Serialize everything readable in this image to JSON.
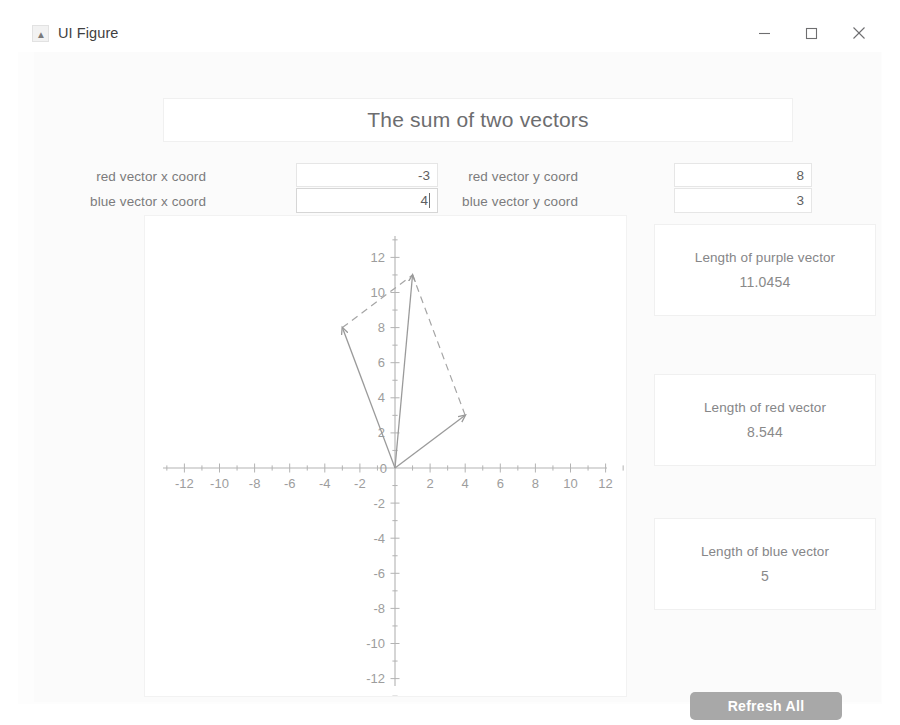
{
  "window": {
    "title": "UI Figure",
    "icon": "matlab-app-icon",
    "controls": {
      "minimize": "minimize-icon",
      "maximize": "maximize-icon",
      "close": "close-icon"
    }
  },
  "header": {
    "title": "The sum of two vectors"
  },
  "inputs": [
    {
      "id": "red-x",
      "label": "red vector x coord",
      "value": "-3",
      "focused": false
    },
    {
      "id": "red-y",
      "label": "red vector y coord",
      "value": "8",
      "focused": false
    },
    {
      "id": "blue-x",
      "label": "blue vector x coord",
      "value": "4",
      "focused": true
    },
    {
      "id": "blue-y",
      "label": "blue vector y coord",
      "value": "3",
      "focused": false
    }
  ],
  "results": [
    {
      "id": "purple",
      "label": "Length of purple vector",
      "value": "11.0454"
    },
    {
      "id": "red",
      "label": "Length of red vector",
      "value": "8.544"
    },
    {
      "id": "blue",
      "label": "Length of blue vector",
      "value": "5"
    }
  ],
  "actions": {
    "refresh_label": "Refresh All"
  },
  "chart_data": {
    "type": "scatter",
    "title": "",
    "xlabel": "",
    "ylabel": "",
    "xlim": [
      -13.5,
      13.5
    ],
    "ylim": [
      -13.5,
      13.5
    ],
    "grid": false,
    "xticks": [
      -12,
      -10,
      -8,
      -6,
      -4,
      -2,
      0,
      2,
      4,
      6,
      8,
      10,
      12
    ],
    "yticks": [
      -12,
      -10,
      -8,
      -6,
      -4,
      -2,
      0,
      2,
      4,
      6,
      8,
      10,
      12
    ],
    "minor_tick_step": 1,
    "origin_label": "0",
    "vectors": [
      {
        "name": "red vector",
        "from": [
          0,
          0
        ],
        "to": [
          -3,
          8
        ],
        "color": "#9a9a9a",
        "style": "solid",
        "arrow": true
      },
      {
        "name": "blue vector",
        "from": [
          0,
          0
        ],
        "to": [
          4,
          3
        ],
        "color": "#9a9a9a",
        "style": "solid",
        "arrow": true
      },
      {
        "name": "purple vector",
        "from": [
          0,
          0
        ],
        "to": [
          1,
          11
        ],
        "color": "#9a9a9a",
        "style": "solid",
        "arrow": true
      }
    ],
    "construction_lines": [
      {
        "name": "parallel-to-blue",
        "from": [
          -3,
          8
        ],
        "to": [
          1,
          11
        ],
        "color": "#a5a5a5",
        "style": "dashed"
      },
      {
        "name": "parallel-to-red",
        "from": [
          4,
          3
        ],
        "to": [
          1,
          11
        ],
        "color": "#a5a5a5",
        "style": "dashed"
      }
    ],
    "axis_color": "#b3b3b3",
    "tick_label_color": "#9d9d9d"
  }
}
